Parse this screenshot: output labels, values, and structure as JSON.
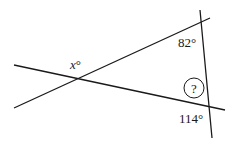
{
  "diagram": {
    "type": "geometry-angles",
    "lines": [
      {
        "id": "line-a",
        "x1": 14,
        "y1": 108,
        "x2": 210,
        "y2": 18
      },
      {
        "id": "line-b",
        "x1": 14,
        "y1": 65,
        "x2": 225,
        "y2": 110
      },
      {
        "id": "line-c",
        "x1": 200,
        "y1": 10,
        "x2": 212,
        "y2": 138
      }
    ],
    "labels": {
      "x_angle": {
        "var": "x",
        "unit": "°"
      },
      "angle_82": "82°",
      "angle_114": "114°",
      "unknown": "?"
    },
    "colors": {
      "stroke": "#1a1a1a",
      "background": "#ffffff"
    }
  }
}
